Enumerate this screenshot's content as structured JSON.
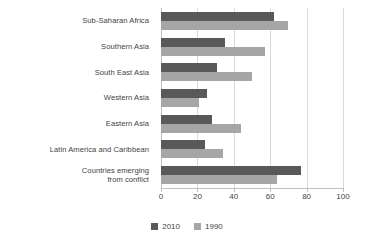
{
  "chart_data": {
    "type": "bar",
    "orientation": "horizontal",
    "title": "",
    "subtitle": "",
    "xlabel": "",
    "ylabel": "",
    "xlim": [
      0,
      100
    ],
    "xticks": [
      0,
      20,
      40,
      60,
      80,
      100
    ],
    "grid": true,
    "legend_position": "bottom",
    "categories": [
      "Sub-Saharan Africa",
      "Southern Asia",
      "South East Asia",
      "Western Asia",
      "Eastern Asia",
      "Latin America and Caribbean",
      "Countries emerging\nfrom conflict"
    ],
    "series": [
      {
        "name": "2010",
        "color": "#595959",
        "values": [
          62,
          35,
          31,
          25,
          28,
          24,
          77
        ]
      },
      {
        "name": "1990",
        "color": "#a6a6a6",
        "values": [
          70,
          57,
          50,
          21,
          44,
          34,
          64
        ]
      }
    ]
  },
  "legend": {
    "items": [
      {
        "label": "2010",
        "color": "#595959"
      },
      {
        "label": "1990",
        "color": "#a6a6a6"
      }
    ]
  },
  "axis": {
    "tick_labels": [
      "0",
      "20",
      "40",
      "60",
      "80",
      "100"
    ]
  }
}
